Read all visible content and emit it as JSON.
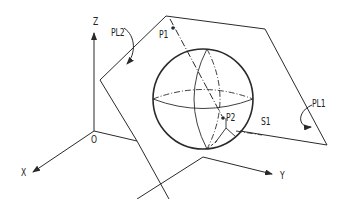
{
  "diagram": {
    "type": "3d-geometry-illustration",
    "axes": {
      "x_label": "X",
      "y_label": "Y",
      "z_label": "Z",
      "origin_label": "O"
    },
    "labels": {
      "plane1": "PL1",
      "plane2": "PL2",
      "point1": "P1",
      "point2": "P2",
      "sphere": "S1"
    },
    "colors": {
      "line": "#2a2a2a",
      "background": "#ffffff"
    }
  }
}
